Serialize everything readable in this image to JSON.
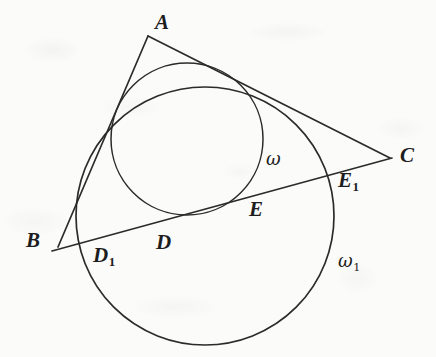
{
  "figure": {
    "kind": "euclidean-geometry-diagram",
    "background_color": "#fbfbfa",
    "ink_color": "#2b2b2b"
  },
  "points": [
    {
      "id": "A",
      "label": "A",
      "sub": "",
      "x": 155,
      "y": 12,
      "vertex_x": 148,
      "vertex_y": 36
    },
    {
      "id": "B",
      "label": "B",
      "sub": "",
      "x": 26,
      "y": 230,
      "vertex_x": 58,
      "vertex_y": 247
    },
    {
      "id": "C",
      "label": "C",
      "sub": "",
      "x": 400,
      "y": 145,
      "vertex_x": 390,
      "vertex_y": 158
    },
    {
      "id": "D",
      "label": "D",
      "sub": "",
      "x": 156,
      "y": 232,
      "vertex_x": 163,
      "vertex_y": 213
    },
    {
      "id": "D1",
      "label": "D",
      "sub": "1",
      "x": 93,
      "y": 245,
      "vertex_x": 103,
      "vertex_y": 231
    },
    {
      "id": "E",
      "label": "E",
      "sub": "",
      "x": 249,
      "y": 199,
      "vertex_x": 249,
      "vertex_y": 188
    },
    {
      "id": "E1",
      "label": "E",
      "sub": "1",
      "x": 338,
      "y": 170,
      "vertex_x": 330,
      "vertex_y": 172
    }
  ],
  "circle_labels": [
    {
      "id": "omega",
      "label": "ω",
      "sub": "",
      "x": 266,
      "y": 150
    },
    {
      "id": "omega1",
      "label": "ω",
      "sub": "1",
      "x": 338,
      "y": 252
    }
  ],
  "circles": [
    {
      "id": "omega",
      "cx": 187,
      "cy": 139,
      "r": 76
    },
    {
      "id": "omega1",
      "cx": 205,
      "cy": 216,
      "r": 129
    }
  ],
  "segments": [
    {
      "id": "AB",
      "x1": 148,
      "y1": 36,
      "x2": 58,
      "y2": 247
    },
    {
      "id": "AC",
      "x1": 148,
      "y1": 36,
      "x2": 390,
      "y2": 158
    },
    {
      "id": "BC",
      "x1": 52,
      "y1": 251,
      "x2": 392,
      "y2": 158
    }
  ]
}
